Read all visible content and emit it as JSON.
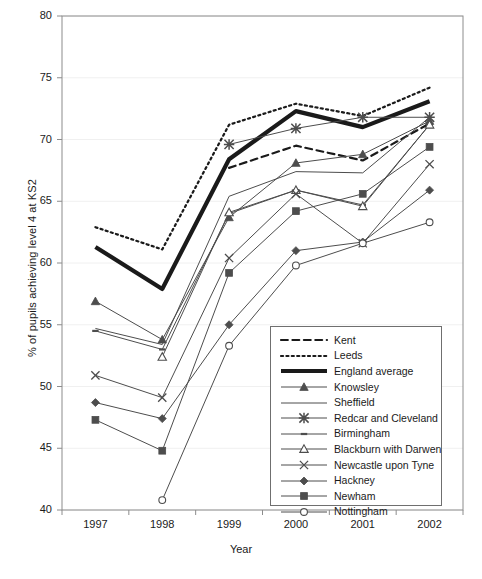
{
  "chart_data": {
    "type": "line",
    "title": "",
    "xlabel": "Year",
    "ylabel": "% of pupils achieving level 4 at KS2",
    "categories": [
      "1997",
      "1998",
      "1999",
      "2000",
      "2001",
      "2002"
    ],
    "x": [
      1997,
      1998,
      1999,
      2000,
      2001,
      2002
    ],
    "ylim": [
      40,
      80
    ],
    "yticks": [
      40,
      45,
      50,
      55,
      60,
      65,
      70,
      75,
      80
    ],
    "ytick_labels": [
      "40",
      "45",
      "50",
      "55",
      "60",
      "65",
      "70",
      "75",
      "80"
    ],
    "grid": "horizontal-faint",
    "legend_position": "inside-bottom-right",
    "series": [
      {
        "name": "Kent",
        "values": [
          null,
          null,
          67.7,
          69.5,
          68.3,
          71.3
        ],
        "style": "dashed",
        "marker": "none",
        "width": 2.2
      },
      {
        "name": "Leeds",
        "values": [
          62.9,
          61.1,
          71.2,
          72.9,
          71.9,
          74.2
        ],
        "style": "dotted",
        "marker": "none",
        "width": 2.2
      },
      {
        "name": "England average",
        "values": [
          61.3,
          57.9,
          68.4,
          72.3,
          71.0,
          73.1
        ],
        "style": "solid",
        "marker": "none",
        "width": 4.2
      },
      {
        "name": "Knowsley",
        "values": [
          56.9,
          53.8,
          63.7,
          68.1,
          68.8,
          71.5
        ],
        "style": "solid",
        "marker": "triangle-up",
        "width": 1.0
      },
      {
        "name": "Sheffield",
        "values": [
          54.7,
          53.4,
          65.4,
          67.4,
          67.3,
          71.8
        ],
        "style": "solid",
        "marker": "none",
        "width": 1.0
      },
      {
        "name": "Redcar and Cleveland",
        "values": [
          null,
          null,
          69.6,
          70.9,
          71.8,
          71.8
        ],
        "style": "solid",
        "marker": "asterisk",
        "width": 1.0
      },
      {
        "name": "Birmingham",
        "values": [
          54.5,
          53.0,
          64.0,
          65.9,
          64.7,
          71.2
        ],
        "style": "solid",
        "marker": "dash",
        "width": 1.0
      },
      {
        "name": "Blackburn with Darwen",
        "values": [
          null,
          52.4,
          64.1,
          65.9,
          64.6,
          71.2
        ],
        "style": "solid",
        "marker": "triangle-open",
        "width": 1.0
      },
      {
        "name": "Newcastle upon Tyne",
        "values": [
          50.9,
          49.1,
          60.4,
          65.6,
          61.6,
          68.0
        ],
        "style": "solid",
        "marker": "cross-x",
        "width": 1.0
      },
      {
        "name": "Hackney",
        "values": [
          48.7,
          47.4,
          55.0,
          61.0,
          61.7,
          65.9
        ],
        "style": "solid",
        "marker": "diamond",
        "width": 1.0
      },
      {
        "name": "Newham",
        "values": [
          47.3,
          44.8,
          59.2,
          64.2,
          65.6,
          69.4
        ],
        "style": "solid",
        "marker": "square",
        "width": 1.0
      },
      {
        "name": "Nottingham",
        "values": [
          null,
          40.8,
          53.3,
          59.8,
          61.6,
          63.3
        ],
        "style": "solid",
        "marker": "circle-open",
        "width": 1.0
      }
    ]
  },
  "legend": {
    "entries": [
      {
        "label": "Kent"
      },
      {
        "label": "Leeds"
      },
      {
        "label": "England average"
      },
      {
        "label": "Knowsley"
      },
      {
        "label": "Sheffield"
      },
      {
        "label": "Redcar and Cleveland"
      },
      {
        "label": "Birmingham"
      },
      {
        "label": "Blackburn with Darwen"
      },
      {
        "label": "Newcastle upon Tyne"
      },
      {
        "label": "Hackney"
      },
      {
        "label": "Newham"
      },
      {
        "label": "Nottingham"
      }
    ]
  },
  "colors": {
    "line": "#1a1a1a",
    "thin_line": "#4d4d4d",
    "axis": "#8c8c8c",
    "grid": "#f0f0f0",
    "text": "#1a1a1a",
    "legend_border": "#6f6f6f",
    "background": "#ffffff"
  }
}
